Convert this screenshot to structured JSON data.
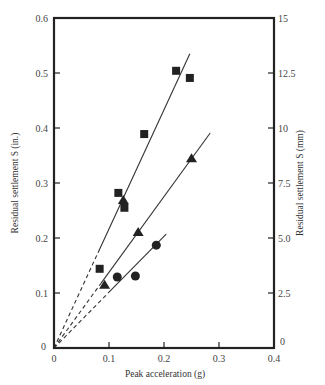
{
  "chart_data": {
    "type": "scatter",
    "title": "",
    "xlabel": "Peak acceleration (g)",
    "ylabel": "Residual settlement S (in.)",
    "ylabel_right": "Residual settlement S (mm)",
    "xlim": [
      0,
      0.4
    ],
    "ylim": [
      0,
      0.6
    ],
    "ylim_right": [
      0,
      15
    ],
    "x_ticks": [
      "0",
      "0.1",
      "0.2",
      "0.3",
      "0.4"
    ],
    "y_ticks": [
      "0",
      "0.1",
      "0.2",
      "0.3",
      "0.4",
      "0.5",
      "0.6"
    ],
    "y_ticks_right": [
      "0",
      "2.5",
      "5.0",
      "7.5",
      "10",
      "12.5",
      "15"
    ],
    "grid": false,
    "legend": null,
    "series": [
      {
        "name": "squares",
        "marker": "square",
        "points": [
          [
            0.083,
            0.144
          ],
          [
            0.117,
            0.282
          ],
          [
            0.128,
            0.255
          ],
          [
            0.164,
            0.389
          ],
          [
            0.222,
            0.504
          ],
          [
            0.247,
            0.491
          ]
        ],
        "fit_line": {
          "from": [
            0,
            0
          ],
          "to": [
            0.247,
            0.535
          ],
          "dashed_until_x": 0.08
        }
      },
      {
        "name": "triangles",
        "marker": "triangle",
        "points": [
          [
            0.092,
            0.115
          ],
          [
            0.126,
            0.269
          ],
          [
            0.153,
            0.211
          ],
          [
            0.25,
            0.345
          ]
        ],
        "fit_line": {
          "from": [
            0,
            0
          ],
          "to": [
            0.284,
            0.391
          ],
          "dashed_until_x": 0.085
        }
      },
      {
        "name": "circles",
        "marker": "circle",
        "points": [
          [
            0.115,
            0.129
          ],
          [
            0.148,
            0.131
          ],
          [
            0.186,
            0.187
          ]
        ],
        "fit_line": {
          "from": [
            0,
            0
          ],
          "to": [
            0.204,
            0.207
          ],
          "dashed_until_x": 0.1
        }
      }
    ]
  },
  "labels": {
    "xlabel": "Peak acceleration (g)",
    "ylabel_left": "Residual settlement S (in.)",
    "ylabel_right": "Residual settlement S (mm)"
  }
}
